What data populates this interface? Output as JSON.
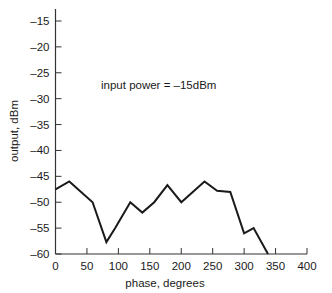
{
  "chart_data": {
    "type": "line",
    "title": "",
    "xlabel": "phase, degrees",
    "ylabel": "output, dBm",
    "xlim": [
      0,
      400
    ],
    "ylim": [
      -60,
      -15
    ],
    "xticks": [
      0,
      50,
      100,
      150,
      200,
      250,
      300,
      350,
      400
    ],
    "yticks": [
      -15,
      -20,
      -25,
      -30,
      -35,
      -40,
      -45,
      -50,
      -55,
      -60
    ],
    "xtick_labels": [
      "0",
      "50",
      "100",
      "150",
      "200",
      "250",
      "300",
      "350",
      "400"
    ],
    "ytick_labels": [
      "–15",
      "–20",
      "–25",
      "–30",
      "–35",
      "–40",
      "–45",
      "–50",
      "–55",
      "–60"
    ],
    "grid": false,
    "legend": null,
    "annotations": [
      {
        "text": "input power = –15dBm",
        "x": 73,
        "y": -27
      }
    ],
    "series": [
      {
        "name": "output",
        "color": "#1a1a1a",
        "x": [
          0,
          22,
          59,
          81,
          95,
          119,
          138,
          157,
          178,
          200,
          237,
          257,
          278,
          300,
          315,
          338
        ],
        "y": [
          -47.5,
          -46,
          -50,
          -57.7,
          -55,
          -50,
          -52,
          -50,
          -46.7,
          -50,
          -46,
          -47.8,
          -48,
          -56,
          -55,
          -60
        ]
      }
    ]
  },
  "labels": {
    "xlabel": "phase, degrees",
    "ylabel": "output, dBm",
    "annotation": "input power = –15dBm"
  }
}
